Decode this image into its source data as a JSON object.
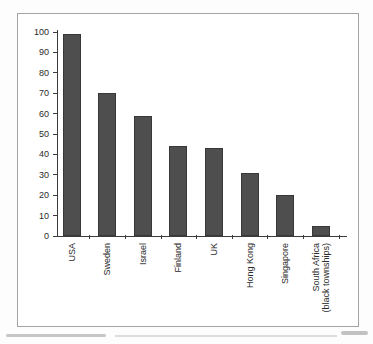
{
  "figure": {
    "background": "#ffffff",
    "frame_color": "#a3a3a3"
  },
  "chart_data": {
    "type": "bar",
    "categories": [
      "USA",
      "Sweden",
      "Israel",
      "Finland",
      "UK",
      "Hong Kong",
      "Singapore",
      "South Africa\n(black townships)"
    ],
    "values": [
      99,
      70,
      59,
      44,
      43,
      31,
      20,
      5
    ],
    "title": "",
    "xlabel": "",
    "ylabel": "",
    "ylim": [
      0,
      100
    ],
    "ytick_step": 10,
    "grid": false,
    "legend": false,
    "bar_color": "#4e4e4e",
    "bar_edge_color": "#383838",
    "axis_color": "#3c3c3c",
    "text_color": "#2b2b2b"
  }
}
